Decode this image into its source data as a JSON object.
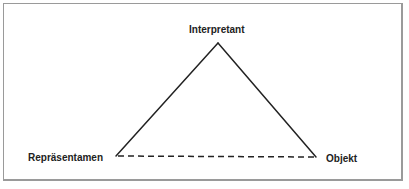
{
  "diagram": {
    "type": "semiotic-triangle",
    "nodes": {
      "top": {
        "label": "Interpretant",
        "x": 218,
        "y": 43
      },
      "left": {
        "label": "Repräsentamen",
        "x": 116,
        "y": 156
      },
      "right": {
        "label": "Objekt",
        "x": 316,
        "y": 157
      }
    },
    "edges": [
      {
        "from": "Repräsentamen",
        "to": "Interpretant",
        "style": "solid"
      },
      {
        "from": "Interpretant",
        "to": "Objekt",
        "style": "solid"
      },
      {
        "from": "Repräsentamen",
        "to": "Objekt",
        "style": "dashed"
      }
    ],
    "colors": {
      "line": "#222222",
      "text": "#222222",
      "frame": "#9a9a9a",
      "background": "#ffffff"
    }
  }
}
